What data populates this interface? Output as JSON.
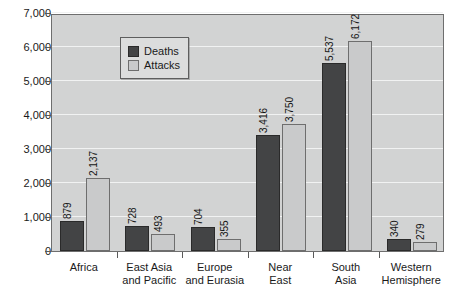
{
  "chart_data": {
    "type": "bar",
    "title": "",
    "subtitle": "",
    "xlabel": "",
    "ylabel": "",
    "ylim": [
      0,
      7000
    ],
    "ytick_labels": [
      "0",
      "1,000",
      "2,000",
      "3,000",
      "4,000",
      "5,000",
      "6,000",
      "7,000"
    ],
    "ytick_values": [
      0,
      1000,
      2000,
      3000,
      4000,
      5000,
      6000,
      7000
    ],
    "grid": true,
    "legend_position": "top-left",
    "categories": [
      "Africa",
      "East Asia and Pacific",
      "Europe and Eurasia",
      "Near East",
      "South Asia",
      "Western Hemisphere"
    ],
    "category_lines": [
      [
        "Africa"
      ],
      [
        "East Asia",
        "and Pacific"
      ],
      [
        "Europe",
        "and Eurasia"
      ],
      [
        "Near",
        "East"
      ],
      [
        "South",
        "Asia"
      ],
      [
        "Western",
        "Hemisphere"
      ]
    ],
    "series": [
      {
        "name": "Deaths",
        "color": "#434445",
        "values": [
          879,
          728,
          704,
          3416,
          5537,
          340
        ],
        "labels": [
          "879",
          "728",
          "704",
          "3,416",
          "5,537",
          "340"
        ]
      },
      {
        "name": "Attacks",
        "color": "#c9cacb",
        "values": [
          2137,
          493,
          355,
          3750,
          6172,
          279
        ],
        "labels": [
          "2,137",
          "493",
          "355",
          "3,750",
          "6,172",
          "279"
        ]
      }
    ]
  },
  "legend": {
    "items": [
      {
        "label": "Deaths",
        "swatch": "deaths-swatch"
      },
      {
        "label": "Attacks",
        "swatch": "attacks-swatch"
      }
    ]
  },
  "colors": {
    "deaths": "#434445",
    "attacks": "#c9cacb",
    "plot_background": "#d2d3d3",
    "gridline": "#f1f2f2",
    "axis": "#6e6e6e",
    "text": "#1a1a1a",
    "page_background": "#ffffff"
  }
}
